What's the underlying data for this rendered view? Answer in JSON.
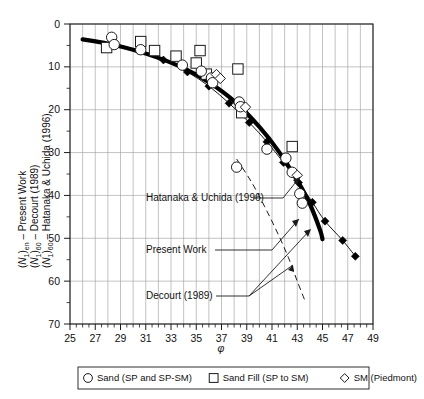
{
  "chart_data": {
    "type": "scatter",
    "title": "",
    "xlabel": "φ",
    "ylabel_lines": [
      "(N1)en – Present Work",
      "(N1)60 – Decourt (1989)",
      "(N1)60 – Hatanaka & Uchida (1996)"
    ],
    "xlim": [
      25,
      49
    ],
    "ylim": [
      70,
      0
    ],
    "y_inverted": true,
    "xticks": [
      25,
      27,
      29,
      31,
      33,
      35,
      37,
      39,
      41,
      43,
      45,
      47,
      49
    ],
    "xticks_minor_step": 0.5,
    "yticks": [
      0,
      10,
      20,
      30,
      40,
      50,
      60,
      70
    ],
    "yticks_minor": [
      5,
      15,
      25,
      35,
      45,
      55,
      65
    ],
    "grid": true,
    "grid_x_step": 1,
    "grid_color": "#9a9a9a",
    "legend_position": "below-axes",
    "series": [
      {
        "name": "Present Work",
        "type": "line",
        "style": "thick-solid",
        "color": "#000000",
        "linewidth": 4.2,
        "points": [
          [
            26.0,
            3.6
          ],
          [
            28.0,
            4.6
          ],
          [
            30.0,
            6.0
          ],
          [
            32.0,
            7.9
          ],
          [
            34.0,
            10.3
          ],
          [
            36.0,
            13.6
          ],
          [
            38.0,
            18.0
          ],
          [
            40.0,
            24.0
          ],
          [
            41.5,
            29.6
          ],
          [
            43.0,
            36.5
          ],
          [
            44.0,
            42.0
          ],
          [
            44.8,
            48.0
          ],
          [
            45.0,
            50.2
          ]
        ]
      },
      {
        "name": "Hatanaka & Uchida (1996)",
        "type": "line-with-markers",
        "style": "thin-solid-filled-diamond",
        "color": "#000000",
        "linewidth": 0.9,
        "points": [
          [
            28.4,
            4.4
          ],
          [
            30.4,
            6.2
          ],
          [
            32.4,
            8.4
          ],
          [
            34.3,
            11.2
          ],
          [
            36.0,
            14.5
          ],
          [
            37.6,
            18.5
          ],
          [
            39.2,
            23.0
          ],
          [
            40.6,
            27.5
          ],
          [
            41.9,
            32.3
          ],
          [
            43.1,
            37.0
          ],
          [
            44.2,
            41.6
          ],
          [
            45.2,
            46.0
          ],
          [
            46.6,
            50.5
          ],
          [
            47.6,
            54.2
          ]
        ]
      },
      {
        "name": "Decourt (1989)",
        "type": "line",
        "style": "thin-dashed",
        "color": "#000000",
        "linewidth": 0.9,
        "points": [
          [
            38.2,
            31.5
          ],
          [
            39.4,
            37.0
          ],
          [
            40.4,
            42.5
          ],
          [
            41.4,
            48.5
          ],
          [
            42.3,
            54.5
          ],
          [
            43.0,
            60.0
          ],
          [
            43.6,
            64.5
          ]
        ]
      },
      {
        "name": "Sand (SP and SP-SM)",
        "type": "scatter",
        "marker": "circle-open",
        "points": [
          [
            28.3,
            3.1
          ],
          [
            28.5,
            4.8
          ],
          [
            30.6,
            6.0
          ],
          [
            33.9,
            9.6
          ],
          [
            35.4,
            11.0
          ],
          [
            36.2,
            12.6
          ],
          [
            36.3,
            13.7
          ],
          [
            38.4,
            18.2
          ],
          [
            38.5,
            19.3
          ],
          [
            38.2,
            33.4
          ],
          [
            40.6,
            29.2
          ],
          [
            42.1,
            31.3
          ],
          [
            42.6,
            34.6
          ],
          [
            43.2,
            39.6
          ],
          [
            43.4,
            41.8
          ]
        ]
      },
      {
        "name": "Sand Fill (SP to SM)",
        "type": "scatter",
        "marker": "square-open",
        "points": [
          [
            27.9,
            5.5
          ],
          [
            30.6,
            4.1
          ],
          [
            31.7,
            6.2
          ],
          [
            33.4,
            7.5
          ],
          [
            35.0,
            9.1
          ],
          [
            35.3,
            6.2
          ],
          [
            35.8,
            11.7
          ],
          [
            38.3,
            10.5
          ],
          [
            38.6,
            20.7
          ],
          [
            42.6,
            28.6
          ]
        ]
      },
      {
        "name": "SM (Piedmont)",
        "type": "scatter",
        "marker": "diamond-open",
        "points": [
          [
            36.6,
            11.8
          ],
          [
            36.9,
            12.7
          ],
          [
            38.9,
            19.4
          ],
          [
            43.0,
            35.3
          ]
        ]
      }
    ],
    "annotations": [
      {
        "text": "Hatanaka & Uchida (1996)",
        "x_px": 146,
        "y_px": 201
      },
      {
        "text": "Present Work",
        "x_px": 146,
        "y_px": 253
      },
      {
        "text": "Decourt (1989)",
        "x_px": 146,
        "y_px": 299
      }
    ]
  },
  "axes": {
    "xlabel": "φ",
    "xticks": [
      "25",
      "27",
      "29",
      "31",
      "33",
      "35",
      "37",
      "39",
      "41",
      "43",
      "45",
      "47",
      "49"
    ],
    "yticks": [
      "0",
      "10",
      "20",
      "30",
      "40",
      "50",
      "60",
      "70"
    ],
    "ylabel": {
      "line1_pre": "(",
      "line1_N": "N",
      "line1_sub1": "1",
      "line1_mid": ")",
      "line1_sub2": "en",
      "line1_post": " – Present Work",
      "line2_pre": "(",
      "line2_N": "N",
      "line2_sub1": "1",
      "line2_mid": ")",
      "line2_sub2": "60",
      "line2_post": " – Decourt (1989)",
      "line3_pre": "(",
      "line3_N": "N",
      "line3_sub1": "1",
      "line3_mid": ")",
      "line3_sub2": "60",
      "line3_post": " – Hatanaka & Uchida (1996)"
    }
  },
  "annotations": {
    "hatanaka": "Hatanaka & Uchida (1996)",
    "present": "Present Work",
    "decourt": "Decourt (1989)"
  },
  "legend": {
    "items": [
      {
        "marker": "circle-open",
        "label": "Sand (SP and SP-SM)"
      },
      {
        "marker": "square-open",
        "label": "Sand Fill (SP to SM)"
      },
      {
        "marker": "diamond-open",
        "label": "SM (Piedmont)"
      }
    ]
  }
}
